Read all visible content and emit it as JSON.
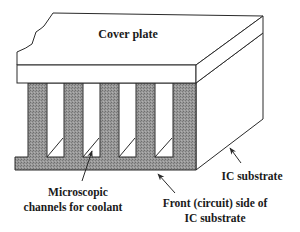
{
  "diagram": {
    "colors": {
      "line": "#2a2a2a",
      "fin_fill": "#8c8c8c",
      "background": "#ffffff"
    },
    "labels": {
      "cover_plate": "Cover plate",
      "ic_substrate": "IC substrate",
      "channels_line1": "Microscopic",
      "channels_line2": "channels for coolant",
      "front_line1": "Front (circuit) side of",
      "front_line2": "IC substrate"
    },
    "components": [
      {
        "name": "cover-plate",
        "label": "Cover plate"
      },
      {
        "name": "microchannel-fins",
        "count": 5
      },
      {
        "name": "microchannels",
        "count": 4
      },
      {
        "name": "ic-substrate",
        "label": "IC substrate"
      }
    ]
  }
}
